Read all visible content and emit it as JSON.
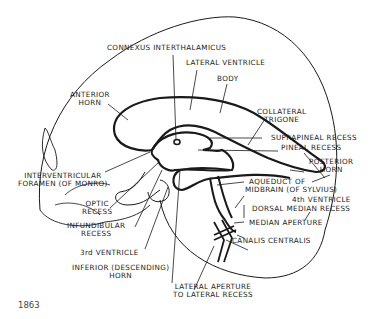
{
  "figure": {
    "number": "1863",
    "colors": {
      "line": "#1a1a1a",
      "background": "#ffffff",
      "caption": "#444444"
    }
  },
  "labels": {
    "connexus": "CONNEXUS INTERTHALAMICUS",
    "lateral_ventricle": "LATERAL VENTRICLE",
    "body": "BODY",
    "anterior_horn_1": "ANTERIOR",
    "anterior_horn_2": "HORN",
    "collateral_1": "COLLATERAL",
    "collateral_2": "TRIGONE",
    "suprapineal": "SUPRAPINEAL RECESS",
    "pineal": "PINEAL RECESS",
    "posterior_horn_1": "POSTERIOR",
    "posterior_horn_2": "HORN",
    "aqueduct_1": "AQUEDUCT OF",
    "aqueduct_2": "MIDBRAIN (OF SYLVIUS)",
    "fourth_ventricle": "4th VENTRICLE",
    "dorsal_median": "DORSAL MEDIAN RECESS",
    "median_aperture": "MEDIAN APERTURE",
    "canalis": "CANALIS CENTRALIS",
    "interventricular_1": "INTERVENTRICULAR",
    "interventricular_2": "FORAMEN (OF MONRO)",
    "optic_1": "OPTIC",
    "optic_2": "RECESS",
    "infundibular_1": "INFUNDIBULAR",
    "infundibular_2": "RECESS",
    "third_ventricle": "3rd VENTRICLE",
    "inferior_horn_1": "INFERIOR (DESCENDING)",
    "inferior_horn_2": "HORN",
    "lateral_aperture_1": "LATERAL APERTURE",
    "lateral_aperture_2": "TO LATERAL RECESS"
  }
}
